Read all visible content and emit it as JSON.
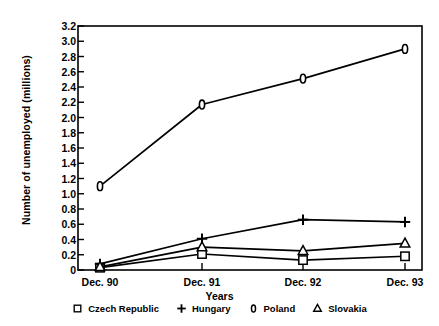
{
  "chart_data": {
    "type": "line",
    "title": "",
    "xlabel": "Years",
    "ylabel": "Number of unemployed (millions)",
    "categories": [
      "Dec. 90",
      "Dec. 91",
      "Dec. 92",
      "Dec. 93"
    ],
    "ylim": [
      0,
      3.2
    ],
    "yticks": [
      "0",
      "0.2",
      "0.4",
      "0.6",
      "0.8",
      "1.0",
      "1.2",
      "1.4",
      "1.6",
      "1.8",
      "2.0",
      "2.2",
      "2.4",
      "2.6",
      "2.8",
      "3.0",
      "3.2"
    ],
    "ytick_values": [
      0,
      0.2,
      0.4,
      0.6,
      0.8,
      1.0,
      1.2,
      1.4,
      1.6,
      1.8,
      2.0,
      2.2,
      2.4,
      2.6,
      2.8,
      3.0,
      3.2
    ],
    "grid": false,
    "legend_position": "bottom",
    "line_color": "#000000",
    "series": [
      {
        "name": "Czech Republic",
        "marker": "open-square",
        "values": [
          0.03,
          0.21,
          0.13,
          0.18
        ]
      },
      {
        "name": "Hungary",
        "marker": "plus",
        "values": [
          0.08,
          0.41,
          0.66,
          0.63
        ]
      },
      {
        "name": "Poland",
        "marker": "open-diamond",
        "values": [
          1.1,
          2.17,
          2.51,
          2.9
        ]
      },
      {
        "name": "Slovakia",
        "marker": "open-triangle",
        "values": [
          0.04,
          0.3,
          0.25,
          0.35
        ]
      }
    ]
  },
  "legend": {
    "items": [
      {
        "label": "Czech Republic",
        "marker_name": "open-square-marker-icon"
      },
      {
        "label": "Hungary",
        "marker_name": "plus-marker-icon"
      },
      {
        "label": "Poland",
        "marker_name": "open-diamond-marker-icon"
      },
      {
        "label": "Slovakia",
        "marker_name": "open-triangle-marker-icon"
      }
    ]
  }
}
